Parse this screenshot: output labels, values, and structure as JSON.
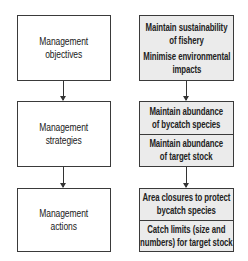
{
  "left_column": [
    {
      "lines": [
        "Management",
        "objectives"
      ]
    },
    {
      "lines": [
        "Management",
        "strategies"
      ]
    },
    {
      "lines": [
        "Management",
        "actions"
      ]
    }
  ],
  "right_column": [
    {
      "items": [
        {
          "lines": [
            "Maintain sustainability",
            "of fishery"
          ]
        },
        {
          "lines": [
            "Minimise environmental",
            "impacts"
          ]
        }
      ]
    },
    {
      "items": [
        {
          "lines": [
            "Maintain abundance",
            "of bycatch species"
          ]
        },
        {
          "lines": [
            "Maintain abundance",
            "of target stock"
          ]
        }
      ]
    },
    {
      "items": [
        {
          "lines": [
            "Area closures to protect",
            "bycatch species"
          ]
        },
        {
          "lines": [
            "Catch limits (size and",
            "numbers) for target stock"
          ]
        }
      ]
    }
  ],
  "colors": {
    "right_box_fill": "#ebebeb",
    "left_box_fill": "#ffffff",
    "border": "#3a3a3a"
  }
}
